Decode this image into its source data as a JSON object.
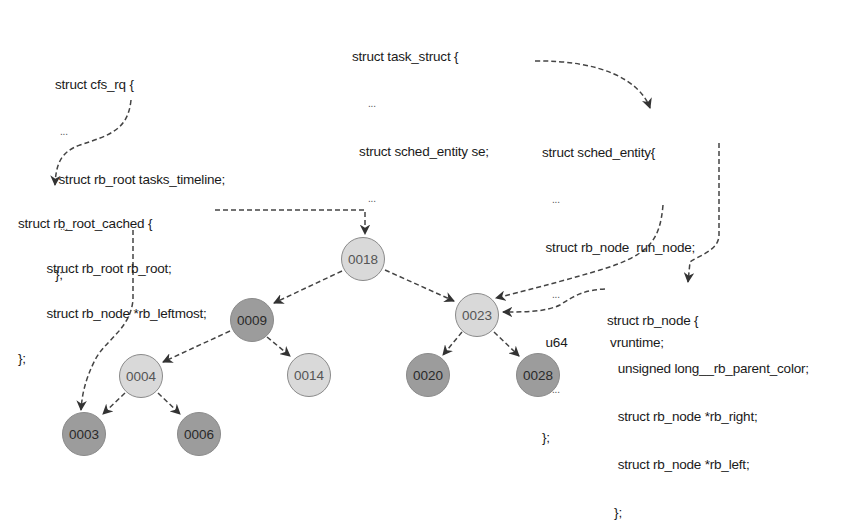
{
  "colors": {
    "light_node": "#d9d9d9",
    "dark_node": "#9c9c9c",
    "node_border": "#8a8a8a",
    "arrow": "#333333"
  },
  "structs": {
    "cfs_rq": {
      "lines": [
        "struct cfs_rq {",
        "...",
        " struct rb_root tasks_timeline;",
        "...",
        "};"
      ]
    },
    "task_struct": {
      "lines": [
        "struct task_struct {",
        "...",
        "  struct sched_entity se;",
        "...",
        "}"
      ]
    },
    "sched_entity": {
      "lines": [
        "struct sched_entity{",
        "...",
        " struct rb_node  run_node;",
        "...",
        " u64            vruntime;",
        "...",
        "};"
      ]
    },
    "rb_root_cached": {
      "lines": [
        "struct rb_root_cached {",
        "        struct rb_root rb_root;",
        "        struct rb_node *rb_leftmost;",
        "};"
      ]
    },
    "rb_node": {
      "lines": [
        "struct rb_node {",
        "   unsigned long__rb_parent_color;",
        "   struct rb_node *rb_right;",
        "   struct rb_node *rb_left;",
        "  };"
      ]
    }
  },
  "tree": {
    "nodes": [
      {
        "label": "0018",
        "color": "light"
      },
      {
        "label": "0009",
        "color": "dark"
      },
      {
        "label": "0023",
        "color": "light"
      },
      {
        "label": "0004",
        "color": "light"
      },
      {
        "label": "0014",
        "color": "light"
      },
      {
        "label": "0020",
        "color": "dark"
      },
      {
        "label": "0028",
        "color": "dark"
      },
      {
        "label": "0003",
        "color": "dark"
      },
      {
        "label": "0006",
        "color": "dark"
      }
    ],
    "edges": [
      [
        "0018",
        "0009"
      ],
      [
        "0018",
        "0023"
      ],
      [
        "0009",
        "0004"
      ],
      [
        "0009",
        "0014"
      ],
      [
        "0023",
        "0020"
      ],
      [
        "0023",
        "0028"
      ],
      [
        "0004",
        "0003"
      ],
      [
        "0004",
        "0006"
      ]
    ]
  }
}
